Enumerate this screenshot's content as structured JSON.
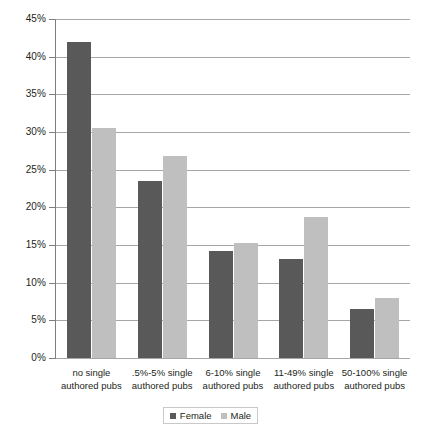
{
  "chart_data": {
    "type": "bar",
    "title": "",
    "xlabel": "",
    "ylabel": "",
    "ylim": [
      0,
      45
    ],
    "ytick_step": 5,
    "grid": true,
    "legend_position": "bottom-center",
    "categories": [
      "no single authored pubs",
      ".5%-5% single authored pubs",
      "6-10% single authored pubs",
      "11-49% single authored pubs",
      "50-100% single authored pubs"
    ],
    "category_lines": [
      [
        "no single",
        "authored pubs"
      ],
      [
        ".5%-5% single",
        "authored pubs"
      ],
      [
        "6-10% single",
        "authored pubs"
      ],
      [
        "11-49% single",
        "authored pubs"
      ],
      [
        "50-100% single",
        "authored pubs"
      ]
    ],
    "ytick_labels": [
      "0%",
      "5%",
      "10%",
      "15%",
      "20%",
      "25%",
      "30%",
      "35%",
      "40%",
      "45%"
    ],
    "ytick_values": [
      0,
      5,
      10,
      15,
      20,
      25,
      30,
      35,
      40,
      45
    ],
    "series": [
      {
        "name": "Female",
        "color": "#595959",
        "values": [
          42.0,
          23.5,
          14.2,
          13.1,
          6.5
        ]
      },
      {
        "name": "Male",
        "color": "#bfbfbf",
        "values": [
          30.5,
          26.8,
          15.3,
          18.7,
          8.0
        ]
      }
    ]
  },
  "colors": {
    "female": "#595959",
    "male": "#bfbfbf",
    "gridline": "#a6a6a6",
    "axis": "#7f7f7f",
    "text": "#231f20",
    "background": "#ffffff"
  }
}
